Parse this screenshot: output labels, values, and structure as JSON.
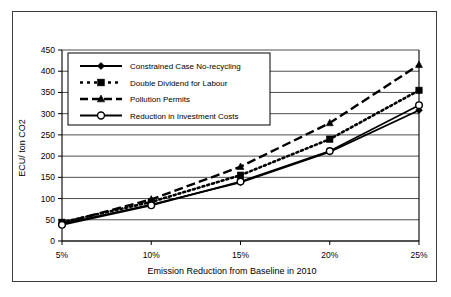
{
  "chart_data": {
    "type": "line",
    "title": "",
    "xlabel": "Emission Reduction from Baseline in 2010",
    "ylabel": "ECU/ ton CO2",
    "x": [
      5,
      10,
      15,
      20,
      25
    ],
    "categories": [
      "5%",
      "10%",
      "15%",
      "20%",
      "25%"
    ],
    "ylim": [
      0,
      450
    ],
    "yticks": [
      0,
      50,
      100,
      150,
      200,
      250,
      300,
      350,
      400,
      450
    ],
    "ytick_labels": [
      "0",
      "50",
      "100",
      "150",
      "200",
      "250",
      "300",
      "350",
      "400",
      "450"
    ],
    "grid": "horizontal",
    "legend_position": "upper-left-inside",
    "series": [
      {
        "name": "Constrained Case No-recycling",
        "marker": "diamond",
        "line_style": "solid",
        "values": [
          40,
          86,
          138,
          210,
          308
        ]
      },
      {
        "name": "Double Dividend for Labour",
        "marker": "square",
        "line_style": "dotted",
        "values": [
          44,
          92,
          155,
          240,
          355
        ]
      },
      {
        "name": "Pollution Permits",
        "marker": "triangle",
        "line_style": "dashed",
        "values": [
          42,
          98,
          175,
          278,
          415
        ]
      },
      {
        "name": "Reduction in Investment Costs",
        "marker": "circle",
        "line_style": "solid",
        "values": [
          38,
          84,
          140,
          212,
          320
        ]
      }
    ]
  },
  "legend": {
    "items": [
      {
        "label": "Constrained Case No-recycling"
      },
      {
        "label": "Double Dividend for Labour"
      },
      {
        "label": "Pollution Permits"
      },
      {
        "label": "Reduction in Investment Costs"
      }
    ]
  }
}
